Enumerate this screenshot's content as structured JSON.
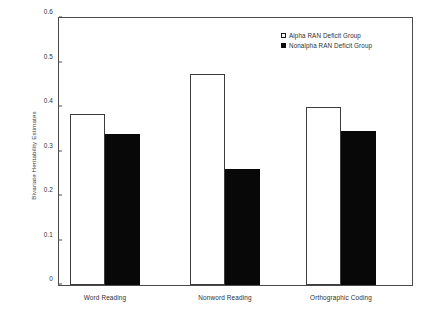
{
  "chart_data": {
    "type": "bar",
    "title": "",
    "xlabel": "",
    "ylabel": "Bivariate Heritability Estimates",
    "categories": [
      "Word Reading",
      "Nonword Reading",
      "Orthographic Coding"
    ],
    "series": [
      {
        "name": "Alpha RAN Deficit Group",
        "style": "open",
        "color": "#ffffff",
        "edge_color": "#000000",
        "values": [
          0.385,
          0.475,
          0.4
        ]
      },
      {
        "name": "Nonalpha RAN Deficit Group",
        "style": "filled",
        "color": "#000000",
        "edge_color": "#000000",
        "values": [
          0.34,
          0.26,
          0.345
        ]
      }
    ],
    "ylim": [
      0,
      0.6
    ],
    "yticks": [
      0,
      0.1,
      0.2,
      0.3,
      0.4,
      0.5,
      0.6
    ],
    "ytick_labels": [
      "0",
      "0.1",
      "0.2",
      "0.3",
      "0.4",
      "0.5",
      "0.6"
    ],
    "grid": false,
    "legend_position": "top-right-inside"
  },
  "legend": {
    "entries": [
      {
        "label": "Alpha RAN Deficit Group"
      },
      {
        "label": "Nonalpha RAN Deficit Group"
      }
    ]
  }
}
